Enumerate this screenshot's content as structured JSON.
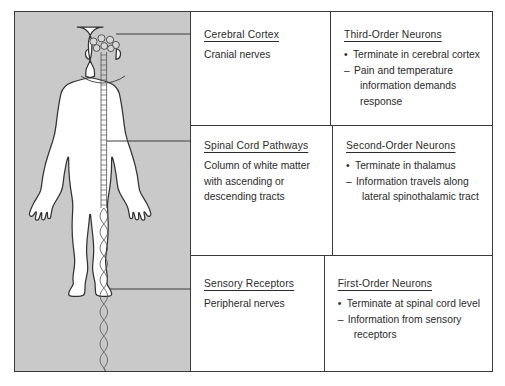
{
  "figure": {
    "name": "sensory-pathway-neuron-orders-diagram",
    "panel_background": "#c9c9c9",
    "body_fill": "#ffffff",
    "outline_color": "#3a3a3a"
  },
  "illustration": {
    "name": "human-body-anterior-silhouette",
    "structures": [
      "brain-nuclei-cluster",
      "spinal-cord-ladder",
      "peripheral-nerve-leg"
    ]
  },
  "leaders": [
    {
      "name": "leader-cerebral-cortex",
      "from": "head",
      "to_row": 1
    },
    {
      "name": "leader-spinal-cord",
      "from": "spinal-cord",
      "to_row": 2
    },
    {
      "name": "leader-sensory-receptors",
      "from": "leg-nerve",
      "to_row": 3
    }
  ],
  "table": {
    "rows": [
      {
        "structure": {
          "title": "Cerebral Cortex",
          "lines": [
            "Cranial nerves"
          ]
        },
        "neuron": {
          "title": "Third-Order Neurons",
          "items": [
            {
              "mark": "•",
              "text": "Terminate in cerebral cortex"
            },
            {
              "mark": "–",
              "text": "Pain and temperature",
              "cont": [
                "information demands",
                "response"
              ]
            }
          ]
        }
      },
      {
        "structure": {
          "title": "Spinal Cord Pathways",
          "lines": [
            "Column of white matter",
            "with ascending or",
            "descending tracts"
          ]
        },
        "neuron": {
          "title": "Second-Order Neurons",
          "items": [
            {
              "mark": "•",
              "text": "Terminate in  thalamus"
            },
            {
              "mark": "–",
              "text": "Information travels along",
              "cont": [
                "lateral spinothalamic tract"
              ]
            }
          ]
        }
      },
      {
        "structure": {
          "title": "Sensory Receptors",
          "lines": [
            "Peripheral nerves"
          ]
        },
        "neuron": {
          "title": "First-Order Neurons",
          "items": [
            {
              "mark": "•",
              "text": "Terminate at spinal cord level"
            },
            {
              "mark": "–",
              "text": "Information from sensory",
              "cont": [
                "receptors"
              ]
            }
          ]
        }
      }
    ]
  }
}
